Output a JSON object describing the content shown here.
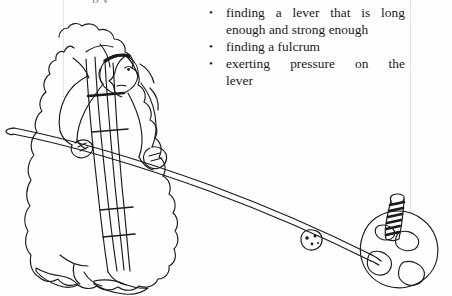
{
  "page": {
    "background_color": "#ffffff",
    "ink_color": "#1a1a1a",
    "rule_color": "#e3e3e3",
    "clipped_top_line": "p y",
    "width": 452,
    "height": 296
  },
  "bullets": [
    {
      "text": "finding a lever that is long enough and strong enough"
    },
    {
      "text": "finding a fulcrum"
    },
    {
      "text": "exerting pressure on the",
      "tail": "lever"
    }
  ],
  "illustration": {
    "title": "Line drawing of a person pushing a long lever resting on a striped fulcrum post set on the Earth",
    "parts": {
      "figure": "robed-person",
      "lever": "long-pole",
      "fulcrum": "striped-post",
      "earth": "globe",
      "moon": "small-round-rock"
    }
  }
}
